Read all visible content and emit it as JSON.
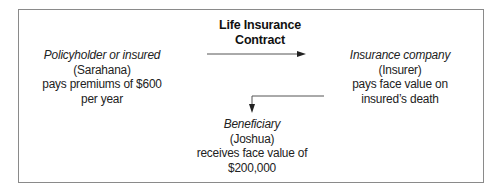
{
  "diagram": {
    "contract_label": [
      "Life Insurance",
      "Contract"
    ],
    "policyholder": {
      "role": "Policyholder or insured",
      "name": "(Sarahana)",
      "action_line1": "pays premiums of $600",
      "action_line2": "per year"
    },
    "insurer": {
      "role": "Insurance company",
      "name": "(Insurer)",
      "action_line1": "pays face value on",
      "action_line2": "insured’s death"
    },
    "beneficiary": {
      "role": "Beneficiary",
      "name": "(Joshua)",
      "action_line1": "receives face value of",
      "action_line2": "$200,000"
    },
    "arrows": [
      {
        "from": "policyholder",
        "to": "insurer",
        "label": "Life Insurance Contract"
      },
      {
        "from": "insurer",
        "to": "beneficiary"
      }
    ],
    "colors": {
      "border": "#8a8a8a",
      "text": "#222222",
      "arrow": "#333333"
    }
  }
}
